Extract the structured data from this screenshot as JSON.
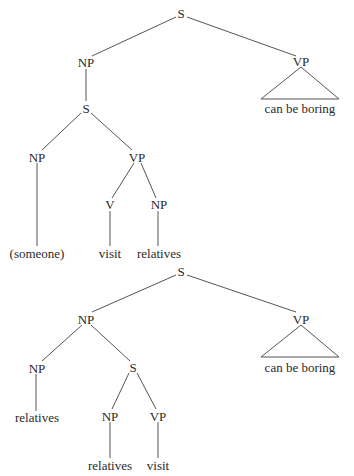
{
  "tree1": {
    "nodes": {
      "s_root": "S",
      "np": "NP",
      "vp": "VP",
      "vp_leaf": "can be boring",
      "s_inner": "S",
      "np_inner": "NP",
      "vp_inner": "VP",
      "v": "V",
      "np_obj": "NP",
      "leaf_someone": "(someone)",
      "leaf_visit": "visit",
      "leaf_relatives": "relatives"
    }
  },
  "tree2": {
    "nodes": {
      "s_root": "S",
      "np": "NP",
      "vp": "VP",
      "vp_leaf": "can be boring",
      "np_head": "NP",
      "s_rel": "S",
      "leaf_relatives_head": "relatives",
      "np_rel": "NP",
      "vp_rel": "VP",
      "leaf_relatives": "relatives",
      "leaf_visit": "visit"
    }
  }
}
